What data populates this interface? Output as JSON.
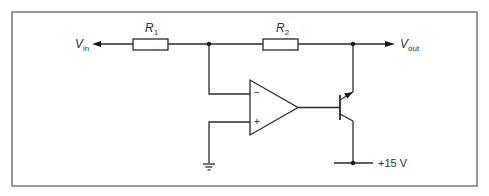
{
  "diagram": {
    "type": "circuit-schematic",
    "colors": {
      "line": "#2a2a2a",
      "frame": "#6e6e6e",
      "background": "#ffffff",
      "text": "#333333"
    },
    "labels": {
      "vin": {
        "main": "V",
        "sub": "in"
      },
      "vout": {
        "main": "V",
        "sub": "out"
      },
      "r1": {
        "main": "R",
        "sub": "1"
      },
      "r2": {
        "main": "R",
        "sub": "2"
      },
      "opamp_inverting": "−",
      "opamp_noninverting": "+",
      "supply": "+15 V"
    },
    "components": [
      {
        "id": "R1",
        "kind": "resistor",
        "label": "R1"
      },
      {
        "id": "R2",
        "kind": "resistor",
        "label": "R2"
      },
      {
        "id": "U1",
        "kind": "op-amp",
        "inputs": [
          "inverting (−)",
          "non-inverting (+)"
        ]
      },
      {
        "id": "Q1",
        "kind": "npn-transistor"
      },
      {
        "id": "GND",
        "kind": "ground"
      }
    ],
    "nets": [
      "Vin → R1 → node A",
      "node A → R2 → node B (Vout)",
      "node A → op-amp inverting input (−)",
      "op-amp non-inverting input (+) → ground",
      "op-amp output → transistor base",
      "transistor emitter → node B (Vout)",
      "transistor collector → +15 V"
    ]
  }
}
